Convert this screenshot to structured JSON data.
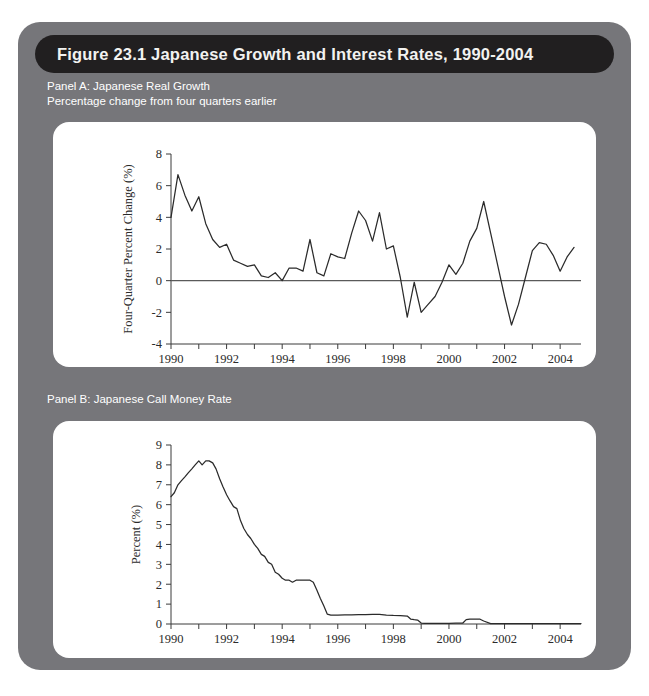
{
  "figure": {
    "title": "Figure 23.1   Japanese Growth and Interest Rates, 1990-2004",
    "card_color": "#76767a",
    "title_bar_color": "#211f20",
    "title_text_color": "#f2f2f0"
  },
  "panelA": {
    "caption_line1": "Panel A: Japanese Real Growth",
    "caption_line2": "Percentage change from four quarters earlier"
  },
  "panelB": {
    "caption_line1": "Panel B: Japanese Call Money Rate",
    "caption_line2": ""
  },
  "chart_data": [
    {
      "type": "line",
      "id": "panel-a-real-growth",
      "title": "Panel A: Japanese Real Growth",
      "subtitle": "Percentage change from four quarters earlier",
      "xlabel": "",
      "ylabel": "Four-Quarter Percent Change (%)",
      "xlim": [
        1990,
        2004.75
      ],
      "ylim": [
        -4,
        8
      ],
      "yticks": [
        -4,
        -2,
        0,
        2,
        4,
        6,
        8
      ],
      "ytick_labels": [
        "-4",
        "-2",
        "0",
        "2",
        "4",
        "6",
        "8"
      ],
      "xticks": [
        1990,
        1991,
        1992,
        1993,
        1994,
        1995,
        1996,
        1997,
        1998,
        1999,
        2000,
        2001,
        2002,
        2003,
        2004
      ],
      "xtick_labels_shown": [
        "1990",
        "1992",
        "1994",
        "1996",
        "1998",
        "2000",
        "2002",
        "2004"
      ],
      "grid": false,
      "legend": "none",
      "zero_line": true,
      "series": [
        {
          "name": "Four-quarter percent change in Japanese real GDP",
          "x": [
            1990.0,
            1990.25,
            1990.5,
            1990.75,
            1991.0,
            1991.25,
            1991.5,
            1991.75,
            1992.0,
            1992.25,
            1992.5,
            1992.75,
            1993.0,
            1993.25,
            1993.5,
            1993.75,
            1994.0,
            1994.25,
            1994.5,
            1994.75,
            1995.0,
            1995.25,
            1995.5,
            1995.75,
            1996.0,
            1996.25,
            1996.5,
            1996.75,
            1997.0,
            1997.25,
            1997.5,
            1997.75,
            1998.0,
            1998.25,
            1998.5,
            1998.75,
            1999.0,
            1999.25,
            1999.5,
            1999.75,
            2000.0,
            2000.25,
            2000.5,
            2000.75,
            2001.0,
            2001.25,
            2001.5,
            2001.75,
            2002.0,
            2002.25,
            2002.5,
            2002.75,
            2003.0,
            2003.25,
            2003.5,
            2003.75,
            2004.0,
            2004.25,
            2004.5
          ],
          "values": [
            4.0,
            6.7,
            5.4,
            4.4,
            5.3,
            3.6,
            2.6,
            2.1,
            2.3,
            1.3,
            1.1,
            0.9,
            1.0,
            0.3,
            0.2,
            0.5,
            0.0,
            0.8,
            0.8,
            0.6,
            2.6,
            0.5,
            0.3,
            1.7,
            1.5,
            1.4,
            3.0,
            4.4,
            3.8,
            2.5,
            4.3,
            2.0,
            2.2,
            0.2,
            -2.3,
            -0.1,
            -2.0,
            -1.5,
            -1.0,
            -0.1,
            1.0,
            0.4,
            1.1,
            2.5,
            3.3,
            5.0,
            3.0,
            1.0,
            -1.0,
            -2.8,
            -1.5,
            0.2,
            1.9,
            2.4,
            2.3,
            1.6,
            0.6,
            1.5,
            2.1
          ]
        }
      ]
    },
    {
      "type": "line",
      "id": "panel-b-call-money-rate",
      "title": "Panel B: Japanese Call Money Rate",
      "subtitle": "",
      "xlabel": "",
      "ylabel": "Percent (%)",
      "xlim": [
        1990,
        2004.75
      ],
      "ylim": [
        0,
        9
      ],
      "yticks": [
        0,
        1,
        2,
        3,
        4,
        5,
        6,
        7,
        8,
        9
      ],
      "ytick_labels": [
        "0",
        "1",
        "2",
        "3",
        "4",
        "5",
        "6",
        "7",
        "8",
        "9"
      ],
      "xticks": [
        1990,
        1991,
        1992,
        1993,
        1994,
        1995,
        1996,
        1997,
        1998,
        1999,
        2000,
        2001,
        2002,
        2003,
        2004
      ],
      "xtick_labels_shown": [
        "1990",
        "1992",
        "1994",
        "1996",
        "1998",
        "2000",
        "2002",
        "2004"
      ],
      "grid": false,
      "legend": "none",
      "zero_line": false,
      "series": [
        {
          "name": "Japanese call money rate",
          "x": [
            1990.0,
            1990.12,
            1990.25,
            1990.37,
            1990.5,
            1990.62,
            1990.75,
            1990.87,
            1991.0,
            1991.12,
            1991.25,
            1991.37,
            1991.5,
            1991.62,
            1991.75,
            1991.87,
            1992.0,
            1992.12,
            1992.25,
            1992.37,
            1992.5,
            1992.62,
            1992.75,
            1992.87,
            1993.0,
            1993.12,
            1993.25,
            1993.37,
            1993.5,
            1993.62,
            1993.75,
            1993.87,
            1994.0,
            1994.12,
            1994.25,
            1994.37,
            1994.5,
            1994.62,
            1994.75,
            1994.87,
            1995.0,
            1995.12,
            1995.25,
            1995.37,
            1995.5,
            1995.62,
            1995.75,
            1995.87,
            1996.0,
            1996.25,
            1996.5,
            1996.75,
            1997.0,
            1997.25,
            1997.5,
            1997.75,
            1998.0,
            1998.25,
            1998.5,
            1998.62,
            1998.75,
            1998.87,
            1999.0,
            1999.12,
            1999.25,
            1999.5,
            1999.75,
            2000.0,
            2000.25,
            2000.5,
            2000.62,
            2000.75,
            2000.87,
            2001.0,
            2001.12,
            2001.25,
            2001.5,
            2001.75,
            2002.0,
            2002.25,
            2002.5,
            2002.75,
            2003.0,
            2003.25,
            2003.5,
            2003.75,
            2004.0,
            2004.25,
            2004.5,
            2004.75
          ],
          "values": [
            6.4,
            6.6,
            7.0,
            7.2,
            7.4,
            7.6,
            7.8,
            8.0,
            8.2,
            8.0,
            8.2,
            8.2,
            8.1,
            7.8,
            7.3,
            6.9,
            6.5,
            6.2,
            5.9,
            5.8,
            5.2,
            4.8,
            4.5,
            4.3,
            4.0,
            3.8,
            3.5,
            3.4,
            3.1,
            3.0,
            2.6,
            2.5,
            2.3,
            2.2,
            2.2,
            2.1,
            2.2,
            2.2,
            2.2,
            2.2,
            2.2,
            2.1,
            1.7,
            1.3,
            0.9,
            0.5,
            0.45,
            0.45,
            0.45,
            0.46,
            0.46,
            0.47,
            0.47,
            0.48,
            0.48,
            0.45,
            0.43,
            0.42,
            0.4,
            0.25,
            0.22,
            0.2,
            0.05,
            0.03,
            0.03,
            0.03,
            0.03,
            0.03,
            0.04,
            0.05,
            0.22,
            0.25,
            0.25,
            0.25,
            0.24,
            0.15,
            0.02,
            0.02,
            0.02,
            0.02,
            0.02,
            0.02,
            0.02,
            0.02,
            0.02,
            0.02,
            0.02,
            0.02,
            0.02,
            0.02
          ]
        }
      ]
    }
  ]
}
